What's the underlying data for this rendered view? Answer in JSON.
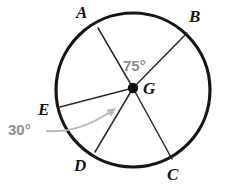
{
  "figure": {
    "type": "circle-diagram",
    "background_color": "#ffffff",
    "stroke_color": "#161616",
    "annotation_color": "#8d8d8d",
    "radius_stroke_color": "#2b2b2b"
  },
  "circle": {
    "name": "circle-G",
    "center_x": 133,
    "center_y": 90,
    "radius": 77,
    "stroke_width": 3.2
  },
  "center_point": {
    "label": "G",
    "x": 133,
    "y": 88,
    "dot_radius": 5.2,
    "label_x": 143,
    "label_y": 80
  },
  "points": [
    {
      "label": "A",
      "x": 98,
      "y": 28,
      "label_x": 76,
      "label_y": 4
    },
    {
      "label": "B",
      "x": 187,
      "y": 33,
      "label_x": 189,
      "label_y": 8
    },
    {
      "label": "C",
      "x": 172,
      "y": 159,
      "label_x": 167,
      "label_y": 166
    },
    {
      "label": "D",
      "x": 95,
      "y": 152,
      "label_x": 74,
      "label_y": 157
    },
    {
      "label": "E",
      "x": 60,
      "y": 107,
      "label_x": 38,
      "label_y": 101
    }
  ],
  "radii": [
    {
      "name": "radius-GA",
      "to": "A"
    },
    {
      "name": "radius-GB",
      "to": "B"
    },
    {
      "name": "radius-GC",
      "to": "C"
    },
    {
      "name": "radius-GD",
      "to": "D"
    },
    {
      "name": "radius-GE",
      "to": "E"
    }
  ],
  "angles": [
    {
      "name": "angle-AGB",
      "value": "75°",
      "between": [
        "A",
        "B"
      ],
      "label_x": 123,
      "label_y": 58,
      "size": "large"
    },
    {
      "name": "angle-EGD",
      "value": "30°",
      "between": [
        "E",
        "D"
      ],
      "label_x": 8,
      "label_y": 122,
      "size": "large"
    }
  ],
  "leader_arrow": {
    "name": "leader-arrow-30deg",
    "color": "#b9b9b9",
    "stroke_width": 2.0,
    "path": "M 47 131 C 72 133, 92 124, 110 112",
    "arrow_tip_x": 116,
    "arrow_tip_y": 108
  }
}
